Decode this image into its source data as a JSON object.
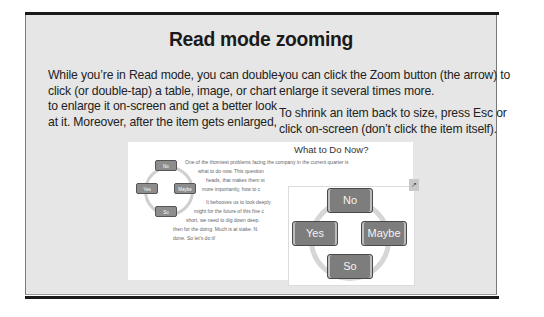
{
  "sidebar": {
    "title": "Read mode zooming",
    "left_column": [
      "While you’re in Read mode, you can double-",
      "click (or double-tap) a table, image, or chart",
      "to enlarge it on-screen and get a better look",
      "at it. Moreover, after the item gets enlarged,"
    ],
    "right_column_p1": [
      "you can click the Zoom button (the arrow) to",
      "enlarge it several times more."
    ],
    "right_column_p2": [
      "To shrink an item back to size, press Esc or",
      "click on-screen (don’t click the item itself)."
    ]
  },
  "screenshot": {
    "doc_title": "What to Do Now?",
    "doc_lines": [
      "One of the thorniest problems facing the company in the current quarter is",
      "what to do now. This question",
      "heads, that makes them st",
      "more importantly, how to c",
      "It behooves us to look deeply",
      "might for the future of this fine c",
      "short, we need to dig down deep.",
      "then for the doing. Much is at stake. N",
      "done. So let’s do it!"
    ],
    "small_diagram": [
      "No",
      "Yes",
      "Maybe",
      "So"
    ],
    "zoom_button_icon": "zoom-arrow-icon",
    "zoomed_diagram": {
      "top": "No",
      "left": "Yes",
      "right": "Maybe",
      "bottom": "So"
    }
  }
}
